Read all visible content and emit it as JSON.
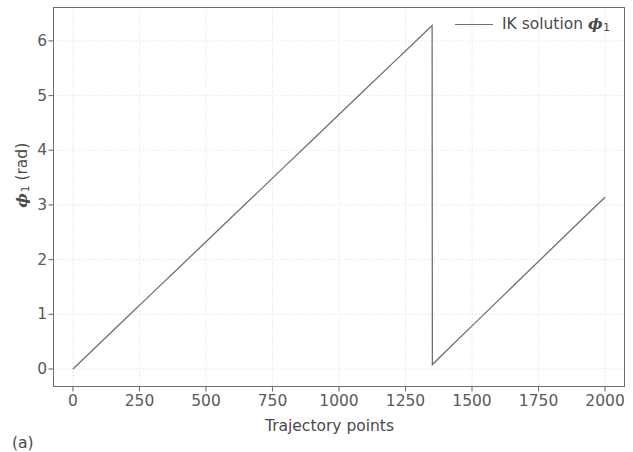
{
  "figure": {
    "subfigure_label": "(a)",
    "background_color": "#ffffff"
  },
  "legend": {
    "entries": [
      {
        "label_prefix": "IK solution ",
        "symbol": "ϕ",
        "symbol_sub": "1",
        "color": "#707070"
      }
    ],
    "position": "upper right",
    "frame": false
  },
  "axes": {
    "xlabel": "Trajectory points",
    "ylabel_prefix": "",
    "ylabel_symbol": "ϕ",
    "ylabel_sub": "1",
    "ylabel_suffix": " (rad)",
    "xticks": [
      "0",
      "250",
      "500",
      "750",
      "1000",
      "1250",
      "1500",
      "1750",
      "2000"
    ],
    "yticks": [
      "0",
      "1",
      "2",
      "3",
      "4",
      "5",
      "6"
    ],
    "tick_color": "#5a5a5a",
    "frame_color": "#6f6f6f",
    "grid_color": "#d8d8e0"
  },
  "chart_data": {
    "type": "line",
    "title": "",
    "xlabel": "Trajectory points",
    "ylabel": "ϕ₁ (rad)",
    "xlim": [
      -75,
      2075
    ],
    "ylim": [
      -0.33,
      6.62
    ],
    "xticks": [
      0,
      250,
      500,
      750,
      1000,
      1250,
      1500,
      1750,
      2000
    ],
    "yticks": [
      0,
      1,
      2,
      3,
      4,
      5,
      6
    ],
    "grid": true,
    "grid_style": "dotted",
    "legend_position": "upper right",
    "series": [
      {
        "name": "IK solution ϕ₁",
        "color": "#707070",
        "linewidth": 1.3,
        "description": "Sawtooth: joint angle wraps at 2π. Rises linearly from 0 to 6.28 rad over points 0-1350, drops discontinuously to 0.08 rad, then rises linearly to 3.14 rad at point 2000.",
        "x": [
          0,
          100,
          200,
          300,
          400,
          500,
          600,
          700,
          800,
          900,
          1000,
          1100,
          1200,
          1300,
          1350,
          1351,
          1400,
          1500,
          1600,
          1700,
          1800,
          1900,
          2000
        ],
        "y": [
          0.0,
          0.465,
          0.931,
          1.396,
          1.861,
          2.327,
          2.792,
          3.257,
          3.723,
          4.188,
          4.653,
          5.119,
          5.584,
          6.049,
          6.283,
          0.08,
          0.316,
          0.788,
          1.259,
          1.731,
          2.202,
          2.674,
          3.142
        ],
        "breakpoints": [
          {
            "x": 1350,
            "y_before": 6.283,
            "y_after": 0.08,
            "type": "wrap-discontinuity"
          }
        ]
      }
    ]
  }
}
